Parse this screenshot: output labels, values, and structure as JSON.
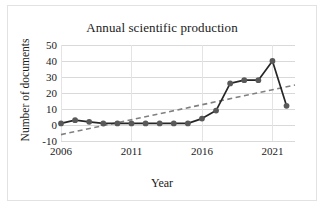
{
  "chart_data": {
    "type": "line",
    "title": "Annual scientific production",
    "xlabel": "Year",
    "ylabel": "Number of documents",
    "grid": true,
    "legend": false,
    "xlim": [
      2006,
      2022.6
    ],
    "ylim": [
      -10,
      50
    ],
    "yticks": [
      50,
      40,
      30,
      20,
      10,
      0,
      -10
    ],
    "xticks": [
      2006,
      2011,
      2016,
      2021
    ],
    "x": [
      2006,
      2007,
      2008,
      2009,
      2010,
      2011,
      2012,
      2013,
      2014,
      2015,
      2016,
      2017,
      2018,
      2019,
      2020,
      2021,
      2022
    ],
    "series": [
      {
        "name": "Number of documents",
        "values": [
          1,
          3,
          2,
          1,
          1,
          1,
          1,
          1,
          1,
          1,
          4,
          9,
          26,
          28,
          28,
          40,
          12
        ],
        "color": "#595959",
        "line_color": "#262626",
        "marker": "circle"
      },
      {
        "name": "Trendline",
        "style": "dashed",
        "color": "#808080",
        "start_value": -6,
        "end_value": 25
      }
    ]
  },
  "figure": {
    "background": "#ffffff",
    "border_color": "#e2e2e2"
  }
}
